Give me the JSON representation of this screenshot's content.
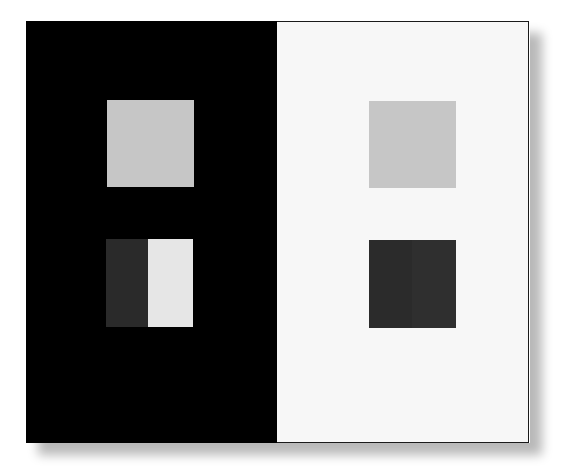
{
  "title": "",
  "illusion": {
    "name": "simultaneous-brightness-contrast",
    "panels": [
      {
        "id": "left",
        "background": "#000000",
        "patches": [
          {
            "id": "gray-target",
            "x": 81,
            "y": 79,
            "w": 87,
            "h": 87,
            "color": "#c6c6c6"
          },
          {
            "id": "dark-half",
            "x": 80,
            "y": 218,
            "w": 42,
            "h": 88,
            "color": "#2a2a2a"
          },
          {
            "id": "light-half",
            "x": 122,
            "y": 218,
            "w": 45,
            "h": 88,
            "color": "#e6e6e6"
          }
        ]
      },
      {
        "id": "right",
        "background": "#f7f7f7",
        "patches": [
          {
            "id": "gray-target",
            "x": 92,
            "y": 79,
            "w": 87,
            "h": 87,
            "color": "#c6c6c6"
          },
          {
            "id": "dark-left-half",
            "x": 92,
            "y": 218,
            "w": 43,
            "h": 88,
            "color": "#2b2b2b"
          },
          {
            "id": "dark-right-half",
            "x": 135,
            "y": 218,
            "w": 44,
            "h": 88,
            "color": "#2f2f2f"
          }
        ]
      }
    ]
  }
}
